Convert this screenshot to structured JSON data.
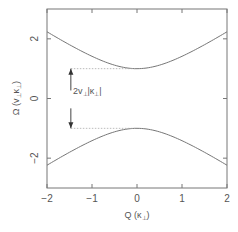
{
  "chart_data": {
    "type": "line",
    "title": "",
    "xlabel": "Q (κ⊥)",
    "ylabel": "Ω (v⊥κ⊥)",
    "xlim": [
      -2,
      2
    ],
    "ylim": [
      -3,
      3
    ],
    "xticks": [
      -2,
      -1,
      0,
      1,
      2
    ],
    "xtick_labels": [
      "−2",
      "−1",
      "0",
      "1",
      "2"
    ],
    "yticks": [
      -2,
      0,
      2
    ],
    "ytick_labels": [
      "−2",
      "0",
      "2"
    ],
    "grid": false,
    "legend": null,
    "series": [
      {
        "name": "upper branch",
        "x": [
          -2,
          -1.5,
          -1,
          -0.5,
          0,
          0.5,
          1,
          1.5,
          2
        ],
        "y": [
          2.24,
          1.8,
          1.41,
          1.12,
          1.0,
          1.12,
          1.41,
          1.8,
          2.24
        ],
        "color": "#777777"
      },
      {
        "name": "lower branch",
        "x": [
          -2,
          -1.5,
          -1,
          -0.5,
          0,
          0.5,
          1,
          1.5,
          2
        ],
        "y": [
          -2.24,
          -1.8,
          -1.41,
          -1.12,
          -1.0,
          -1.12,
          -1.41,
          -1.8,
          -2.24
        ],
        "color": "#777777"
      }
    ],
    "annotations": [
      {
        "type": "dotted-hline",
        "y": 1,
        "x_from": -1.47,
        "x_to": 0
      },
      {
        "type": "dotted-hline",
        "y": -1,
        "x_from": -1.47,
        "x_to": 0
      },
      {
        "type": "arrow",
        "x": -1.47,
        "y_from": 0.27,
        "y_to": 1,
        "direction": "up"
      },
      {
        "type": "arrow",
        "x": -1.47,
        "y_from": -0.33,
        "y_to": -1,
        "direction": "down"
      },
      {
        "type": "text",
        "text": "2v⊥|κ⊥|",
        "x": -1.45,
        "y": 0.25
      }
    ]
  },
  "labels": {
    "xlabel_main": "Q",
    "xlabel_unit": "(κ",
    "xlabel_sub": "⊥",
    "xlabel_close": ")",
    "ylabel_main": "Ω",
    "ylabel_unit": "(v",
    "ylabel_sub1": "⊥",
    "ylabel_mid": "κ",
    "ylabel_sub2": "⊥",
    "ylabel_close": ")",
    "anno_main": "2v",
    "anno_sub1": "⊥",
    "anno_mid": "|κ",
    "anno_sub2": "⊥",
    "anno_close": "|"
  }
}
